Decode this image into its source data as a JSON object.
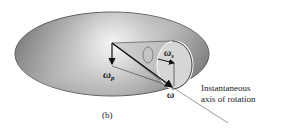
{
  "figure": {
    "caption": "(b)",
    "labels": {
      "omega_p": "ω",
      "omega_p_sub": "p",
      "omega_s": "ω",
      "omega_s_sub": "s",
      "omega": "ω",
      "axis_line1": "Instantaneous",
      "axis_line2": "axis of rotation"
    },
    "colors": {
      "disk_dark": "#5a5a5a",
      "disk_light": "#e6e6e6",
      "cone_fill": "#c8c8c8",
      "cone_base": "#d8d8d8",
      "arrow": "#111111",
      "text": "#1a1a1a"
    }
  }
}
